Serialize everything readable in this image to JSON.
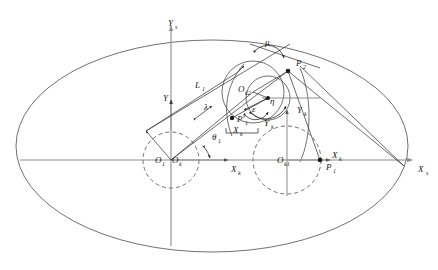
{
  "figure": {
    "type": "geometric-diagram",
    "background_color": "#ffffff",
    "curve_color": "#4d4d4d",
    "axis_color": "#8c8c8c",
    "annotation_color": "#2b2b2b"
  },
  "axes": [
    {
      "name": "global-x-axis",
      "label": "X",
      "subscript": "s",
      "orientation": "horizontal",
      "label_x": 418,
      "label_y": 172,
      "sub_x": 426,
      "sub_y": 175
    },
    {
      "name": "global-y-axis",
      "label": "Y",
      "subscript": "s",
      "orientation": "vertical",
      "label_x": 168,
      "label_y": 26,
      "sub_x": 175,
      "sub_y": 29
    },
    {
      "name": "local-x-axis-k-left",
      "label": "X",
      "subscript": "k",
      "orientation": "horizontal",
      "label_x": 231,
      "label_y": 172,
      "sub_x": 238,
      "sub_y": 175
    },
    {
      "name": "local-y-axis-k-left",
      "label": "Y",
      "subscript": "k",
      "orientation": "vertical",
      "label_x": 163,
      "label_y": 101,
      "sub_x": 170,
      "sub_y": 104
    },
    {
      "name": "local-x-axis-k-right",
      "label": "X",
      "subscript": "k",
      "orientation": "horizontal",
      "label_x": 332,
      "label_y": 158,
      "sub_x": 339,
      "sub_y": 161
    },
    {
      "name": "local-y-axis-k-right",
      "label": "Y",
      "subscript": "k",
      "orientation": "vertical",
      "label_x": 297,
      "label_y": 113,
      "sub_x": 304,
      "sub_y": 116
    },
    {
      "name": "rotated-x-axis-k",
      "label": "X",
      "subscript": "k",
      "orientation": "rotated",
      "label_x": 233,
      "label_y": 133,
      "sub_x": 240,
      "sub_y": 136
    },
    {
      "name": "rotated-y-axis-k",
      "label": "Y",
      "subscript": "k",
      "orientation": "rotated",
      "label_x": 264,
      "label_y": 126,
      "sub_x": 271,
      "sub_y": 129
    }
  ],
  "points": [
    {
      "name": "origin-o1",
      "label": "O",
      "subscript": "1",
      "label_x": 155,
      "label_y": 163,
      "sub_x": 162,
      "sub_y": 166
    },
    {
      "name": "origin-ok",
      "label": "O",
      "subscript": "k",
      "label_x": 172,
      "label_y": 163,
      "sub_x": 179,
      "sub_y": 166
    },
    {
      "name": "center-ok1",
      "label": "O",
      "subscript": "k1",
      "label_x": 277,
      "label_y": 163,
      "sub_x": 284,
      "sub_y": 166
    },
    {
      "name": "center-ok2",
      "label": "O",
      "subscript": "k2",
      "label_x": 238,
      "label_y": 92,
      "sub_x": 245,
      "sub_y": 95
    },
    {
      "name": "point-p1",
      "label": "P",
      "subscript": "1",
      "label_x": 326,
      "label_y": 170,
      "sub_x": 333,
      "sub_y": 173
    },
    {
      "name": "point-p2",
      "label": "P",
      "subscript": "2",
      "label_x": 288,
      "label_y": 66,
      "sub_x": 295,
      "sub_y": 69
    },
    {
      "name": "point-p1-prime",
      "label": "P'",
      "subscript": "1",
      "label_x": 237,
      "label_y": 122,
      "sub_x": 245,
      "sub_y": 125
    }
  ],
  "annotations": [
    {
      "name": "length-l1",
      "label": "L",
      "subscript": "1",
      "label_x": 195,
      "label_y": 88,
      "sub_x": 202,
      "sub_y": 91
    },
    {
      "name": "length-lambda",
      "label": "λ",
      "subscript": "",
      "label_x": 204,
      "label_y": 110,
      "sub_x": 0,
      "sub_y": 0
    },
    {
      "name": "angle-theta1",
      "label": "θ",
      "subscript": "1",
      "label_x": 212,
      "label_y": 140,
      "sub_x": 218,
      "sub_y": 143
    },
    {
      "name": "angle-mu",
      "label": "μ",
      "subscript": "",
      "label_x": 265,
      "label_y": 45,
      "sub_x": 0,
      "sub_y": 0
    },
    {
      "name": "angle-eta",
      "label": "η",
      "subscript": "",
      "label_x": 270,
      "label_y": 104,
      "sub_x": 0,
      "sub_y": 0
    },
    {
      "name": "angle-epsilon",
      "label": "ε",
      "subscript": "",
      "label_x": 255,
      "label_y": 110,
      "sub_x": 0,
      "sub_y": 0
    }
  ],
  "shapes": {
    "outer_ellipse": {
      "cx": 212,
      "cy": 146,
      "rx": 196,
      "ry": 106
    },
    "dashed_circle_left": {
      "cx": 171,
      "cy": 160,
      "r": 28
    },
    "dashed_circle_right": {
      "cx": 287,
      "cy": 160,
      "r": 34
    },
    "solid_circle_upper": {
      "cx": 253,
      "cy": 92,
      "r": 31
    },
    "solid_circle_small": {
      "cx": 268,
      "cy": 98,
      "r": 22
    }
  }
}
